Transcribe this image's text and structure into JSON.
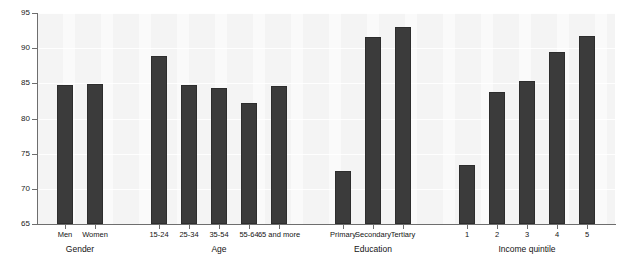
{
  "chart_data": {
    "type": "bar",
    "title": "",
    "subtitle": "",
    "xlabel": "",
    "ylabel": "",
    "ylim": [
      65,
      95
    ],
    "ytick_labels": [
      "65",
      "70",
      "75",
      "80",
      "85",
      "90",
      "95"
    ],
    "ytick_values": [
      65,
      70,
      75,
      80,
      85,
      90,
      95
    ],
    "grid": "horizontal",
    "legend": "none",
    "bar_color": "#3b3b3b",
    "plot_background": "#f4f4f4",
    "axis_color": "#6e6e6e",
    "groups": [
      {
        "name": "Gender",
        "categories": [
          "Men",
          "Women"
        ],
        "values": [
          84.7,
          84.9
        ]
      },
      {
        "name": "Age",
        "categories": [
          "15-24",
          "25-34",
          "35-54",
          "55-64",
          "65 and more"
        ],
        "values": [
          88.9,
          84.7,
          84.3,
          82.2,
          84.6
        ]
      },
      {
        "name": "Education",
        "categories": [
          "Primary",
          "Secondary",
          "Tertiary"
        ],
        "values": [
          72.6,
          91.6,
          93.0
        ]
      },
      {
        "name": "Income quintile",
        "categories": [
          "1",
          "2",
          "3",
          "4",
          "5"
        ],
        "values": [
          73.4,
          83.8,
          85.3,
          89.4,
          91.8
        ]
      }
    ],
    "categories": [
      "Men",
      "Women",
      "15-24",
      "25-34",
      "35-54",
      "55-64",
      "65 and more",
      "Primary",
      "Secondary",
      "Tertiary",
      "1",
      "2",
      "3",
      "4",
      "5"
    ],
    "values": [
      84.7,
      84.9,
      88.9,
      84.7,
      84.3,
      82.2,
      84.6,
      72.6,
      91.6,
      93.0,
      73.4,
      83.8,
      85.3,
      89.4,
      91.8
    ]
  }
}
